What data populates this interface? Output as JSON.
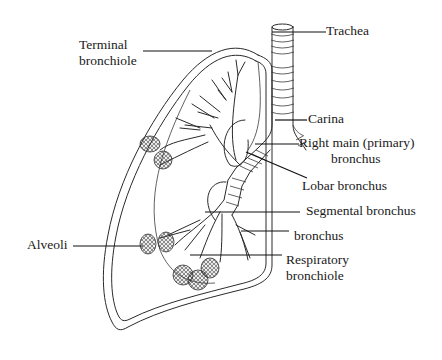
{
  "diagram": {
    "colors": {
      "background": "#ffffff",
      "line": "#2a2a2a",
      "text": "#1a1a1a"
    },
    "labels": {
      "terminal_bronchiole": {
        "line1": "Terminal",
        "line2": "bronchiole"
      },
      "trachea": {
        "line1": "Trachea"
      },
      "carina": {
        "line1": "Carina"
      },
      "right_main_bronchus": {
        "line1": "Right main (primary)",
        "line2": "bronchus"
      },
      "lobar_bronchus": {
        "line1": "Lobar bronchus"
      },
      "segmental_bronchus": {
        "line1": "Segmental bronchus"
      },
      "bronchus": {
        "line1": "bronchus"
      },
      "alveoli": {
        "line1": "Alveoli"
      },
      "respiratory_bronchiole": {
        "line1": "Respiratory",
        "line2": "bronchiole"
      }
    }
  }
}
